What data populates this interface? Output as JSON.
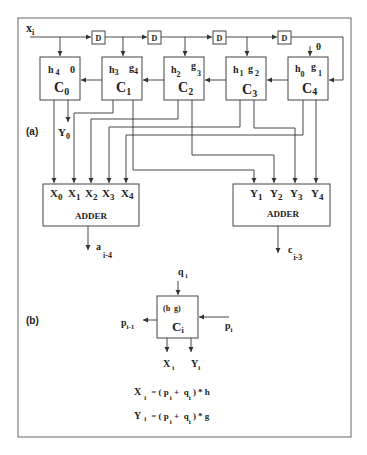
{
  "figure": {
    "part_a": {
      "label": "(a)",
      "input": {
        "main": "x",
        "sub": "i"
      },
      "delay_label": "D",
      "delays": [
        "D",
        "D",
        "D",
        "D"
      ],
      "c4_top_input": "0",
      "cells": [
        {
          "name": "C",
          "sub": "0",
          "h": "h",
          "h_sub": "4",
          "g": "0",
          "g_sub": ""
        },
        {
          "name": "C",
          "sub": "1",
          "h": "h",
          "h_sub": "3",
          "g": "g",
          "g_sub": "4"
        },
        {
          "name": "C",
          "sub": "2",
          "h": "h",
          "h_sub": "2",
          "g": "g",
          "g_sub": "3"
        },
        {
          "name": "C",
          "sub": "3",
          "h": "h",
          "h_sub": "1",
          "g": "g",
          "g_sub": "2"
        },
        {
          "name": "C",
          "sub": "4",
          "h": "h",
          "h_sub": "0",
          "g": "g",
          "g_sub": "1"
        }
      ],
      "y0_output": {
        "main": "Y",
        "sub": "0"
      },
      "adder_x": {
        "title": "ADDER",
        "inputs": [
          {
            "main": "X",
            "sub": "0"
          },
          {
            "main": "X",
            "sub": "1"
          },
          {
            "main": "X",
            "sub": "2"
          },
          {
            "main": "X",
            "sub": "3"
          },
          {
            "main": "X",
            "sub": "4"
          }
        ],
        "output": {
          "main": "a",
          "sub": "i-4"
        }
      },
      "adder_y": {
        "title": "ADDER",
        "inputs": [
          {
            "main": "Y",
            "sub": "1"
          },
          {
            "main": "Y",
            "sub": "2"
          },
          {
            "main": "Y",
            "sub": "3"
          },
          {
            "main": "Y",
            "sub": "4"
          }
        ],
        "output": {
          "main": "c",
          "sub": "i-3"
        }
      }
    },
    "part_b": {
      "label": "(b)",
      "cell": {
        "params": "(h  g)",
        "name": "C",
        "sub": "i"
      },
      "top_input": {
        "main": "q",
        "sub": "i"
      },
      "right_input": {
        "main": "p",
        "sub": "i"
      },
      "left_output": {
        "main": "p",
        "sub": "i-1"
      },
      "bottom_outputs": [
        {
          "main": "X",
          "sub": "i"
        },
        {
          "main": "Y",
          "sub": "i"
        }
      ],
      "equations": [
        {
          "lhs": "X",
          "lhs_sub": "i",
          "rhs_a": "= ( p",
          "rhs_a_sub": "i",
          "rhs_b": " +  q",
          "rhs_b_sub": "i",
          "rhs_c": " ) * h"
        },
        {
          "lhs": "Y",
          "lhs_sub": "i",
          "rhs_a": "= ( p",
          "rhs_a_sub": "i",
          "rhs_b": " +  q",
          "rhs_b_sub": "i",
          "rhs_c": " ) * g"
        }
      ]
    }
  }
}
